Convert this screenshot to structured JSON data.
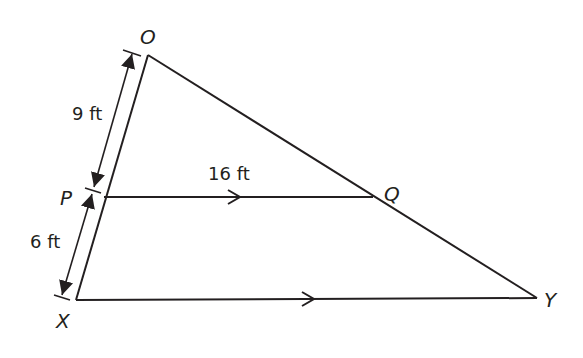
{
  "diagram": {
    "type": "geometry-triangle",
    "points": {
      "O": {
        "label": "O",
        "x": 148,
        "y": 55
      },
      "P": {
        "label": "P",
        "x": 104,
        "y": 197
      },
      "X": {
        "label": "X",
        "x": 76,
        "y": 300
      },
      "Q": {
        "label": "Q",
        "x": 373,
        "y": 197
      },
      "Y": {
        "label": "Y",
        "x": 537,
        "y": 298
      }
    },
    "measurements": {
      "OP": "9 ft",
      "PX": "6 ft",
      "PQ": "16 ft"
    },
    "parallel_marks": [
      "PQ",
      "XY"
    ],
    "colors": {
      "stroke": "#231f20",
      "background": "#ffffff"
    }
  }
}
